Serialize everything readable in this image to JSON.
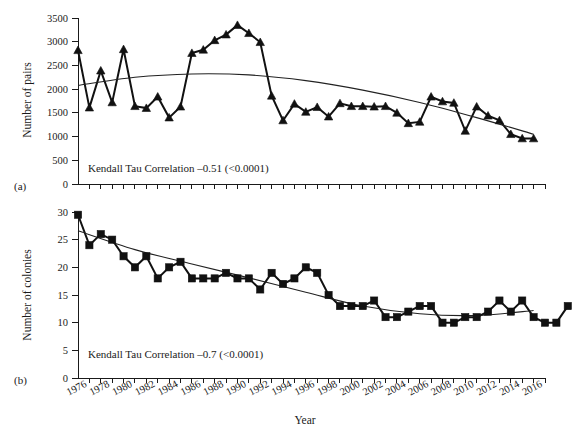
{
  "figure": {
    "xlabel": "Year",
    "panels": [
      {
        "label": "(a)"
      },
      {
        "label": "(b)"
      }
    ]
  },
  "chart_data": [
    {
      "type": "line",
      "panel": "(a)",
      "title": "",
      "xlabel": "",
      "ylabel": "Number of pairs",
      "annotation": "Kendall Tau Correlation –0.51 (<0.0001)",
      "correlation": "-0.51",
      "p_value": "<0.0001",
      "grid": false,
      "legend": "none",
      "xlim": [
        1975,
        2016
      ],
      "ylim": [
        0,
        3500
      ],
      "yticks": [
        0,
        500,
        1000,
        1500,
        2000,
        2500,
        3000,
        3500
      ],
      "xticks": [
        1976,
        1978,
        1980,
        1982,
        1984,
        1986,
        1988,
        1990,
        1992,
        1994,
        1996,
        1998,
        2000,
        2002,
        2004,
        2006,
        2008,
        2010,
        2012,
        2014,
        2016
      ],
      "marker": "triangle",
      "x": [
        1975,
        1976,
        1977,
        1978,
        1979,
        1980,
        1981,
        1982,
        1983,
        1984,
        1985,
        1986,
        1987,
        1988,
        1989,
        1990,
        1991,
        1992,
        1993,
        1994,
        1995,
        1996,
        1997,
        1998,
        1999,
        2000,
        2001,
        2002,
        2003,
        2004,
        2005,
        2006,
        2007,
        2008,
        2009,
        2010,
        2011,
        2012,
        2013,
        2014,
        2015
      ],
      "values": [
        2820,
        1610,
        2390,
        1720,
        2840,
        1640,
        1600,
        1840,
        1400,
        1630,
        2760,
        2830,
        3030,
        3150,
        3350,
        3180,
        2990,
        1860,
        1340,
        1690,
        1520,
        1620,
        1420,
        1700,
        1640,
        1640,
        1630,
        1640,
        1500,
        1280,
        1310,
        1840,
        1740,
        1710,
        1120,
        1630,
        1440,
        1340,
        1050,
        960,
        960
      ],
      "trend": {
        "name": "fitted quadratic trend",
        "x": [
          1975,
          1980,
          1985,
          1990,
          1995,
          2000,
          2005,
          2010,
          2015
        ],
        "values": [
          2080,
          2250,
          2320,
          2300,
          2180,
          1980,
          1720,
          1400,
          1050
        ]
      }
    },
    {
      "type": "line",
      "panel": "(b)",
      "title": "",
      "xlabel": "Year",
      "ylabel": "Number of colonies",
      "annotation": "Kendall Tau Correlation –0.7 (<0.0001)",
      "correlation": "-0.7",
      "p_value": "<0.0001",
      "grid": false,
      "legend": "none",
      "xlim": [
        1975,
        2016
      ],
      "ylim": [
        0,
        30
      ],
      "yticks": [
        0,
        5,
        10,
        15,
        20,
        25,
        30
      ],
      "xticks": [
        1976,
        1978,
        1980,
        1982,
        1984,
        1986,
        1988,
        1990,
        1992,
        1994,
        1996,
        1998,
        2000,
        2002,
        2004,
        2006,
        2008,
        2010,
        2012,
        2014,
        2016
      ],
      "marker": "square",
      "x": [
        1975,
        1976,
        1977,
        1978,
        1979,
        1980,
        1981,
        1982,
        1983,
        1984,
        1985,
        1986,
        1987,
        1988,
        1989,
        1990,
        1991,
        1992,
        1993,
        1994,
        1995,
        1996,
        1997,
        1998,
        1999,
        2000,
        2001,
        2002,
        2003,
        2004,
        2005,
        2006,
        2007,
        2008,
        2009,
        2010,
        2011,
        2012,
        2013,
        2014,
        2015
      ],
      "values": [
        29.5,
        24,
        26,
        25,
        22,
        20,
        22,
        18,
        20,
        21,
        18,
        18,
        18,
        19,
        18,
        18,
        16,
        19,
        17,
        18,
        20,
        19,
        15,
        13,
        13,
        13,
        14,
        11,
        11,
        12,
        13,
        13,
        10,
        10,
        11,
        11,
        12,
        14,
        12,
        14,
        11,
        10,
        10,
        13
      ],
      "trend": {
        "name": "fitted quadratic trend",
        "x": [
          1975,
          1980,
          1985,
          1990,
          1995,
          2000,
          2005,
          2010,
          2015
        ],
        "values": [
          26.6,
          23.2,
          20.6,
          18.1,
          15.5,
          13.0,
          11.6,
          11.3,
          12.2
        ]
      }
    }
  ]
}
